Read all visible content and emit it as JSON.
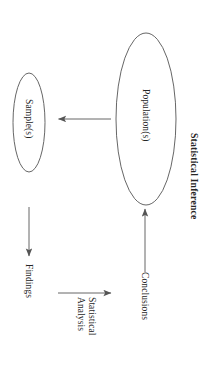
{
  "figure": {
    "title": "Statistical Inference",
    "orientation_degrees": 90,
    "background_color": "#ffffff",
    "stroke_color": "#555555",
    "text_color": "#262626"
  },
  "nodes": [
    {
      "id": "population",
      "label": "Population(s)",
      "shape": "ellipse",
      "cx": 146,
      "cy": 119,
      "rx": 30,
      "ry": 86
    },
    {
      "id": "sample",
      "label": "Sample(s)",
      "shape": "ellipse",
      "cx": 29,
      "cy": 122,
      "rx": 16,
      "ry": 50
    }
  ],
  "edges": [
    {
      "id": "population-to-sample",
      "label": "",
      "from": "population",
      "to": "sample",
      "direction": "left"
    },
    {
      "id": "sample-to-findings",
      "label": "Findings",
      "from": "sample",
      "to": "findings",
      "direction": "down"
    },
    {
      "id": "findings-to-conclusions",
      "label": "Statistical\nAnalysis",
      "label_line1": "Statistical",
      "label_line2": "Analysis",
      "from": "findings",
      "to": "conclusions",
      "direction": "right"
    },
    {
      "id": "conclusions-to-population",
      "label": "Conclusions",
      "from": "conclusions",
      "to": "population",
      "direction": "up"
    }
  ],
  "labels": {
    "population": "Population(s)",
    "sample": "Sample(s)",
    "findings": "Findings",
    "conclusions": "Conclusions",
    "statistical_analysis_line1": "Statistical",
    "statistical_analysis_line2": "Analysis",
    "title": "Statistical Inference"
  }
}
